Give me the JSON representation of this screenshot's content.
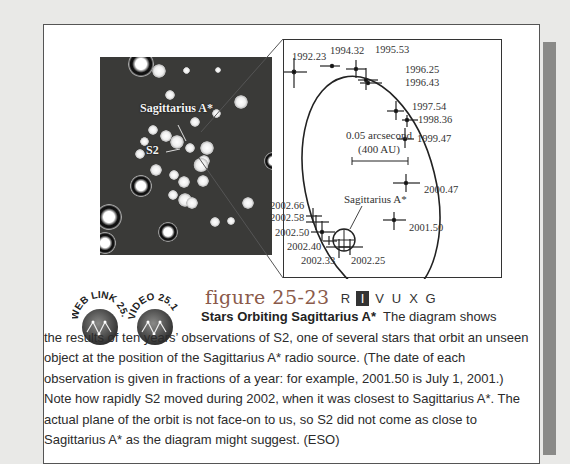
{
  "figure": {
    "number": "figure 25-23",
    "bands": [
      {
        "label": "R",
        "active": false
      },
      {
        "label": "I",
        "active": true
      },
      {
        "label": "V",
        "active": false
      },
      {
        "label": "U",
        "active": false
      },
      {
        "label": "X",
        "active": false
      },
      {
        "label": "G",
        "active": false
      }
    ],
    "title": "Stars Orbiting Sagittarius A*",
    "caption_lead": "The diagram shows",
    "caption_body": "the results of ten years’ observations of S2, one of several stars that orbit an unseen object at the position of the Sagittarius A* radio source. (The date of each observation is given in fractions of a year: for example, 2001.50 is July 1, 2001.) Note how rapidly S2 moved during 2002, when it was closest to Sagittarius A*. The actual plane of the orbit is not face-on to us, so S2 did not come as close to Sagittarius A* as the diagram might suggest. (ESO)"
  },
  "badges": [
    {
      "label": "WEB LINK 25.11",
      "icon": "constellation-icon"
    },
    {
      "label": "VIDEO 25.1",
      "icon": "constellation-icon"
    }
  ],
  "star_image": {
    "labels": {
      "sgr": "Sagittarius A*",
      "s2": "S2"
    }
  },
  "diagram": {
    "scale_label": "0.05 arcsecond",
    "scale_sub": "(400 AU)",
    "center_label": "Sagittarius A*",
    "observations": [
      "1992.23",
      "1994.32",
      "1995.53",
      "1996.25",
      "1996.43",
      "1997.54",
      "1998.36",
      "1999.47",
      "2000.47",
      "2001.50",
      "2002.25",
      "2002.33",
      "2002.40",
      "2002.50",
      "2002.58",
      "2002.66"
    ]
  },
  "colors": {
    "figure_title": "#8a5a4a",
    "frame_border": "#555555",
    "shadow": "#8a8a88",
    "background": "#e9e9e7"
  }
}
